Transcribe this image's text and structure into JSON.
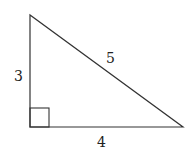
{
  "diagram": {
    "type": "right-triangle",
    "labels": {
      "vertical_side": "3",
      "horizontal_side": "4",
      "hypotenuse": "5"
    },
    "right_angle_marker": true,
    "stroke_color": "#333333"
  }
}
